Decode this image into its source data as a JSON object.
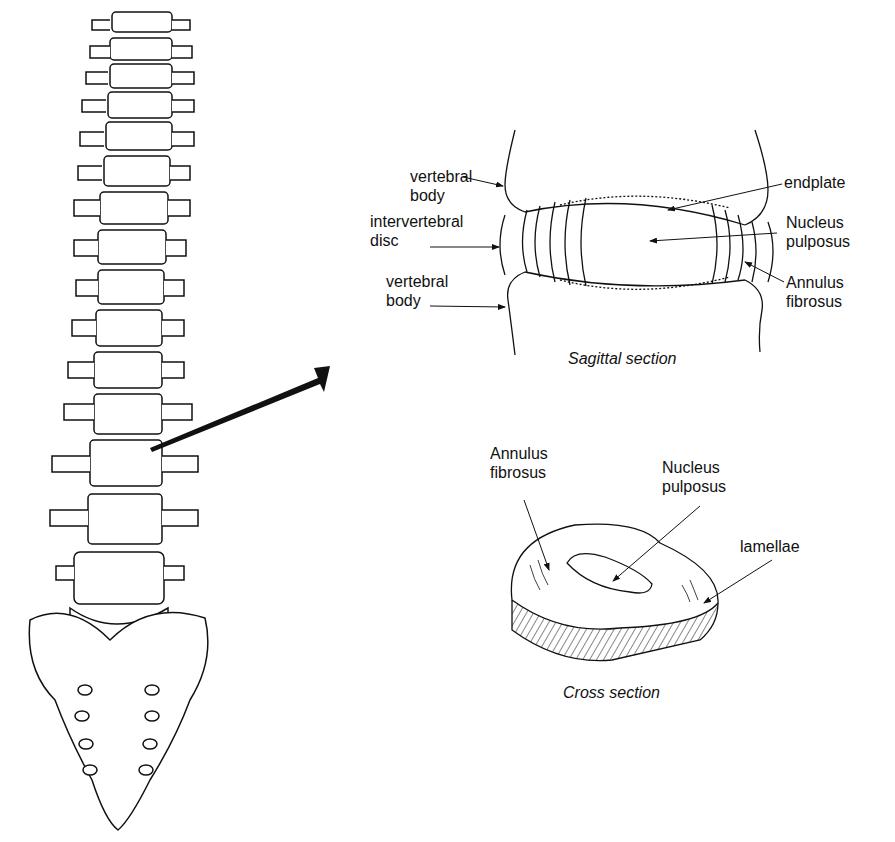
{
  "diagram": {
    "sagittal": {
      "caption": "Sagittal section",
      "labels": {
        "vertebral_body_top_1": "vertebral",
        "vertebral_body_top_2": "body",
        "intervertebral_1": "intervertebral",
        "intervertebral_2": "disc",
        "vertebral_body_bottom_1": "vertebral",
        "vertebral_body_bottom_2": "body",
        "endplate": "endplate",
        "nucleus_1": "Nucleus",
        "nucleus_2": "pulposus",
        "annulus_1": "Annulus",
        "annulus_2": "fibrosus"
      }
    },
    "cross": {
      "caption": "Cross section",
      "labels": {
        "annulus_1": "Annulus",
        "annulus_2": "fibrosus",
        "nucleus_1": "Nucleus",
        "nucleus_2": "pulposus",
        "lamellae": "lamellae"
      }
    }
  }
}
